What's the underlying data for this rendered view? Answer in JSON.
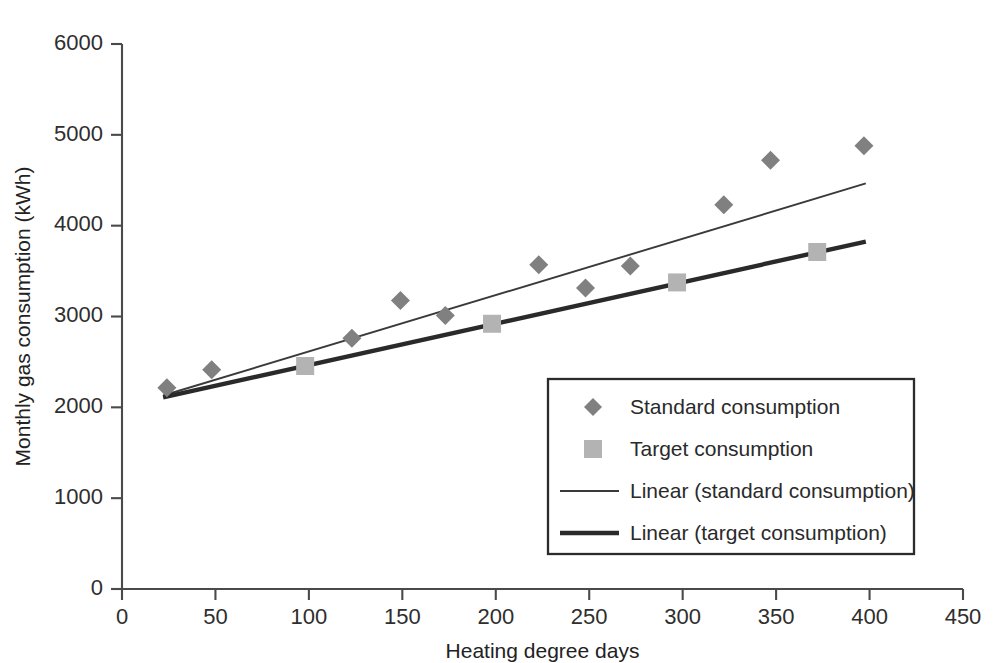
{
  "chart_data": {
    "type": "scatter",
    "title": "",
    "xlabel": "Heating degree days",
    "ylabel": "Monthly gas consumption (kWh)",
    "xlim": [
      0,
      450
    ],
    "ylim": [
      0,
      6000
    ],
    "xticks": [
      0,
      50,
      100,
      150,
      200,
      250,
      300,
      350,
      400,
      450
    ],
    "yticks": [
      0,
      1000,
      2000,
      3000,
      4000,
      5000,
      6000
    ],
    "xtick_labels": [
      "0",
      "50",
      "100",
      "150",
      "200",
      "250",
      "300",
      "350",
      "400",
      "450"
    ],
    "ytick_labels": [
      "0",
      "1000",
      "2000",
      "3000",
      "4000",
      "5000",
      "6000"
    ],
    "grid": false,
    "legend_position": "inside-lower-right",
    "series": [
      {
        "name": "Standard consumption",
        "type": "scatter",
        "marker": "diamond",
        "color": "#808080",
        "points": [
          {
            "x": 24,
            "y": 2215
          },
          {
            "x": 48,
            "y": 2415
          },
          {
            "x": 123,
            "y": 2760
          },
          {
            "x": 149,
            "y": 3175
          },
          {
            "x": 173,
            "y": 3010
          },
          {
            "x": 223,
            "y": 3570
          },
          {
            "x": 248,
            "y": 3315
          },
          {
            "x": 272,
            "y": 3555
          },
          {
            "x": 322,
            "y": 4230
          },
          {
            "x": 347,
            "y": 4720
          },
          {
            "x": 397,
            "y": 4880
          }
        ]
      },
      {
        "name": "Target consumption",
        "type": "scatter",
        "marker": "square",
        "color": "#b3b3b3",
        "points": [
          {
            "x": 98,
            "y": 2455
          },
          {
            "x": 198,
            "y": 2920
          },
          {
            "x": 297,
            "y": 3375
          },
          {
            "x": 372,
            "y": 3710
          }
        ]
      },
      {
        "name": "Linear (standard consumption)",
        "type": "line",
        "style": "thin",
        "color": "#3a3a3a",
        "endpoints": [
          {
            "x": 22,
            "y": 2130
          },
          {
            "x": 398,
            "y": 4465
          }
        ]
      },
      {
        "name": "Linear (target consumption)",
        "type": "line",
        "style": "thick",
        "color": "#2a2a2a",
        "endpoints": [
          {
            "x": 22,
            "y": 2110
          },
          {
            "x": 398,
            "y": 3825
          }
        ]
      }
    ],
    "legend_entries": [
      {
        "label": "Standard consumption",
        "marker": "diamond",
        "color": "#808080"
      },
      {
        "label": "Target consumption",
        "marker": "square",
        "color": "#b3b3b3"
      },
      {
        "label": "Linear (standard consumption)",
        "marker": "line-thin",
        "color": "#3a3a3a"
      },
      {
        "label": "Linear (target consumption)",
        "marker": "line-thick",
        "color": "#2a2a2a"
      }
    ]
  }
}
